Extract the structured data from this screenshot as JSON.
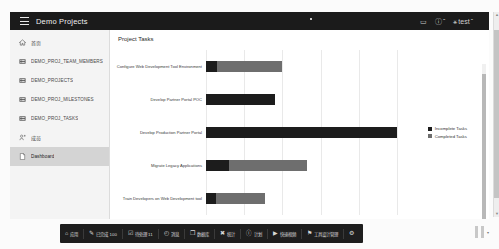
{
  "header": {
    "menu_icon": "hamburger-icon",
    "title": "Demo Projects",
    "icons": [
      {
        "name": "chat-icon",
        "glyph": "▭"
      },
      {
        "name": "help-icon",
        "glyph": "ⓘ",
        "caret": "ˇ"
      },
      {
        "name": "account-icon",
        "glyph": "⚹",
        "label": "test",
        "caret": "ˇ"
      }
    ]
  },
  "sidebar": {
    "items": [
      {
        "label": "首页",
        "icon": "home-icon",
        "active": false,
        "cjk": true
      },
      {
        "label": "DEMO_PROJ_TEAM_MEMBERS",
        "icon": "table-icon",
        "active": false,
        "cjk": false
      },
      {
        "label": "DEMO_PROJECTS",
        "icon": "table-icon",
        "active": false,
        "cjk": false
      },
      {
        "label": "DEMO_PROJ_MILESTONES",
        "icon": "table-icon",
        "active": false,
        "cjk": false
      },
      {
        "label": "DEMO_PROJ_TASKS",
        "icon": "table-icon",
        "active": false,
        "cjk": false
      },
      {
        "label": "成员",
        "icon": "members-icon",
        "active": false,
        "cjk": true
      },
      {
        "label": "Dashboard",
        "icon": "page-icon",
        "active": true,
        "cjk": false
      }
    ]
  },
  "main": {
    "panel_title": "Project Tasks"
  },
  "chart_data": {
    "type": "bar",
    "orientation": "horizontal",
    "stacked": true,
    "title": "Project Tasks",
    "xlabel": "",
    "ylabel": "",
    "grid": true,
    "gridline_values": [
      0,
      2,
      4,
      6,
      8,
      10
    ],
    "xlim": [
      0,
      10
    ],
    "legend_position": "right",
    "categories": [
      "Configure Web Development Tool Environment",
      "Develop Partner Portal POC",
      "Develop Production Partner Portal",
      "Migrate Legacy Applications",
      "Train Developers on Web Development tool"
    ],
    "series": [
      {
        "name": "Incomplete Tasks",
        "color": "#1c1c1c",
        "values": [
          0.6,
          3.6,
          10.0,
          1.2,
          0.5
        ]
      },
      {
        "name": "Completed Tasks",
        "color": "#6e6e6e",
        "values": [
          3.4,
          0.0,
          0.0,
          4.1,
          2.6
        ]
      }
    ]
  },
  "taskbar": {
    "items": [
      {
        "icon": "search-icon",
        "glyph": "⌂",
        "label": "应用"
      },
      {
        "icon": "people-icon",
        "glyph": "✎",
        "label": "已完成 100"
      },
      {
        "icon": "edit-icon",
        "glyph": "☑",
        "label": "待处理 11"
      },
      {
        "icon": "clock-icon",
        "glyph": "◴",
        "label": "消息"
      },
      {
        "icon": "window-icon",
        "glyph": "❐",
        "label": "数据库"
      },
      {
        "icon": "chart-icon",
        "glyph": "✖",
        "label": "统计"
      },
      {
        "icon": "info-icon",
        "glyph": "ⓘ",
        "label": "计划"
      },
      {
        "icon": "video-icon",
        "glyph": "▶",
        "label": "快速视频"
      },
      {
        "icon": "pin-icon",
        "glyph": "⚑",
        "label": "工具设计管理"
      },
      {
        "icon": "gear-icon",
        "glyph": "⚙",
        "label": ""
      }
    ]
  }
}
